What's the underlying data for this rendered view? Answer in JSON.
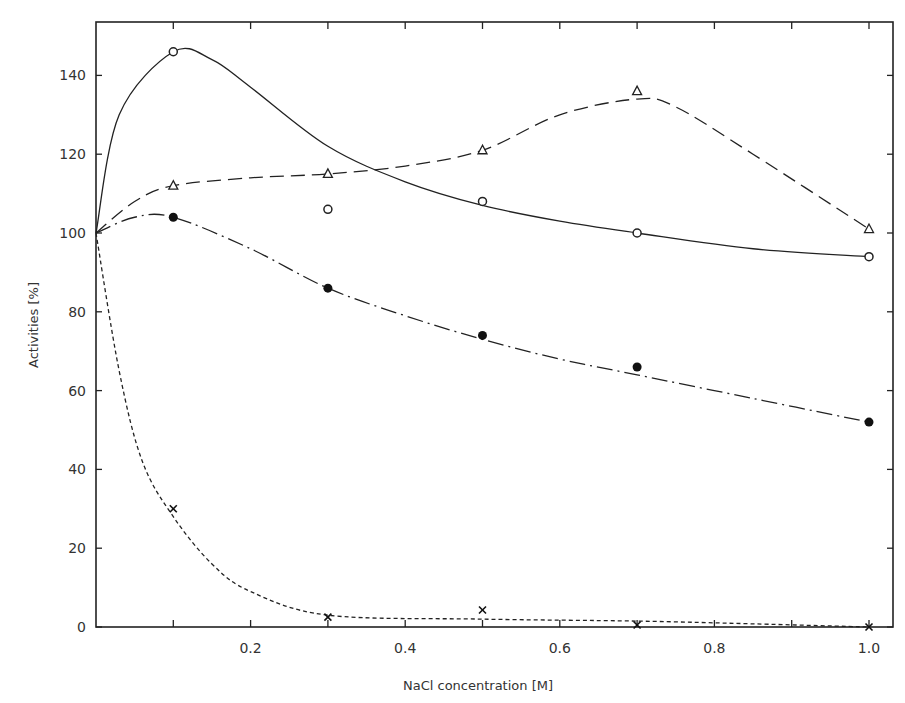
{
  "chart_data": {
    "type": "line",
    "title": "",
    "xlabel": "NaCl concentration [M]",
    "ylabel": "Activities [%]",
    "xlim": [
      0,
      1.0
    ],
    "ylim": [
      0,
      150
    ],
    "x_ticks": [
      0.2,
      0.4,
      0.6,
      0.8,
      1.0
    ],
    "x_tick_labels": [
      "0.2",
      "0.4",
      "0.6",
      "0.8",
      "1.0"
    ],
    "y_ticks": [
      0,
      20,
      40,
      60,
      80,
      100,
      120,
      140
    ],
    "y_tick_labels": [
      "0",
      "20",
      "40",
      "60",
      "80",
      "100",
      "120",
      "140"
    ],
    "grid": false,
    "legend": null,
    "series": [
      {
        "name": "open circles (solid line)",
        "marker": "open-circle",
        "line": "solid",
        "x": [
          0,
          0.1,
          0.3,
          0.5,
          0.7,
          1.0
        ],
        "values": [
          100,
          146,
          106,
          108,
          100,
          94
        ],
        "curve": [
          [
            0,
            100
          ],
          [
            0.03,
            130
          ],
          [
            0.1,
            146
          ],
          [
            0.15,
            144
          ],
          [
            0.2,
            137
          ],
          [
            0.3,
            122
          ],
          [
            0.4,
            113
          ],
          [
            0.5,
            107
          ],
          [
            0.6,
            103
          ],
          [
            0.7,
            100
          ],
          [
            0.85,
            96
          ],
          [
            1.0,
            94
          ]
        ]
      },
      {
        "name": "open triangles (dashed line)",
        "marker": "open-triangle",
        "line": "dashed",
        "x": [
          0,
          0.1,
          0.3,
          0.5,
          0.7,
          1.0
        ],
        "values": [
          100,
          112,
          115,
          121,
          136,
          101
        ],
        "curve": [
          [
            0,
            100
          ],
          [
            0.05,
            108
          ],
          [
            0.1,
            112
          ],
          [
            0.2,
            114
          ],
          [
            0.3,
            115
          ],
          [
            0.4,
            117
          ],
          [
            0.5,
            121
          ],
          [
            0.6,
            130
          ],
          [
            0.7,
            134
          ],
          [
            0.75,
            132
          ],
          [
            0.85,
            120
          ],
          [
            1.0,
            101
          ]
        ]
      },
      {
        "name": "filled circles (dash-dot line)",
        "marker": "filled-circle",
        "line": "dash-dot",
        "x": [
          0,
          0.1,
          0.3,
          0.5,
          0.7,
          1.0
        ],
        "values": [
          100,
          104,
          86,
          74,
          66,
          52
        ],
        "curve": [
          [
            0,
            100
          ],
          [
            0.05,
            104
          ],
          [
            0.1,
            104
          ],
          [
            0.2,
            96
          ],
          [
            0.3,
            86
          ],
          [
            0.4,
            79
          ],
          [
            0.5,
            73
          ],
          [
            0.6,
            68
          ],
          [
            0.7,
            64
          ],
          [
            0.85,
            58
          ],
          [
            1.0,
            52
          ]
        ]
      },
      {
        "name": "crosses (dotted line)",
        "marker": "cross",
        "line": "dotted",
        "x": [
          0,
          0.1,
          0.3,
          0.5,
          0.7,
          1.0
        ],
        "values": [
          100,
          30,
          2.5,
          4.3,
          0.5,
          0
        ],
        "curve": [
          [
            0,
            100
          ],
          [
            0.03,
            65
          ],
          [
            0.06,
            42
          ],
          [
            0.1,
            28
          ],
          [
            0.15,
            16
          ],
          [
            0.2,
            9
          ],
          [
            0.3,
            3
          ],
          [
            0.5,
            2
          ],
          [
            0.7,
            1.5
          ],
          [
            0.85,
            0.8
          ],
          [
            1.0,
            0
          ]
        ]
      }
    ]
  },
  "axes": {
    "xlabel": "NaCl concentration [M]",
    "ylabel": "Activities [%]"
  }
}
